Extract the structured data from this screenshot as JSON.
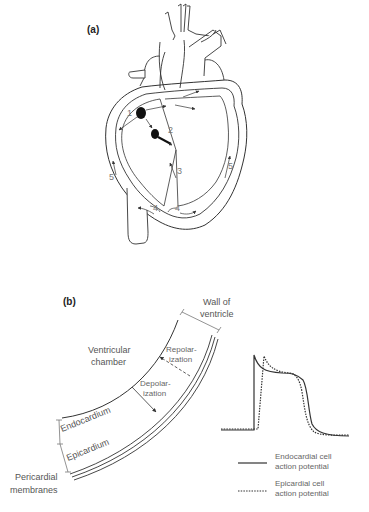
{
  "panel_a": {
    "label": "(a)",
    "markers": {
      "m1": "1",
      "m2": "2",
      "m3": "3",
      "m4_left": "4",
      "m4_right": "4",
      "m5_left": "5",
      "m5_right": "5"
    }
  },
  "panel_b": {
    "label": "(b)",
    "wall_label_line1": "Wall of",
    "wall_label_line2": "ventricle",
    "chamber_line1": "Ventricular",
    "chamber_line2": "chamber",
    "repol_line1": "Repolar-",
    "repol_line2": "ization",
    "depol_line1": "Depolar-",
    "depol_line2": "ization",
    "endocardium": "Endocardium",
    "epicardium": "Epicardium",
    "pericardial_line1": "Pericardial",
    "pericardial_line2": "membranes"
  },
  "legend": {
    "items": [
      {
        "style": "solid",
        "line1": "Endocardial cell",
        "line2": "action potential"
      },
      {
        "style": "dotted",
        "line1": "Epicardial cell",
        "line2": "action potential"
      }
    ]
  },
  "colors": {
    "stroke": "#333333",
    "text": "#555555",
    "node": "#111111"
  }
}
